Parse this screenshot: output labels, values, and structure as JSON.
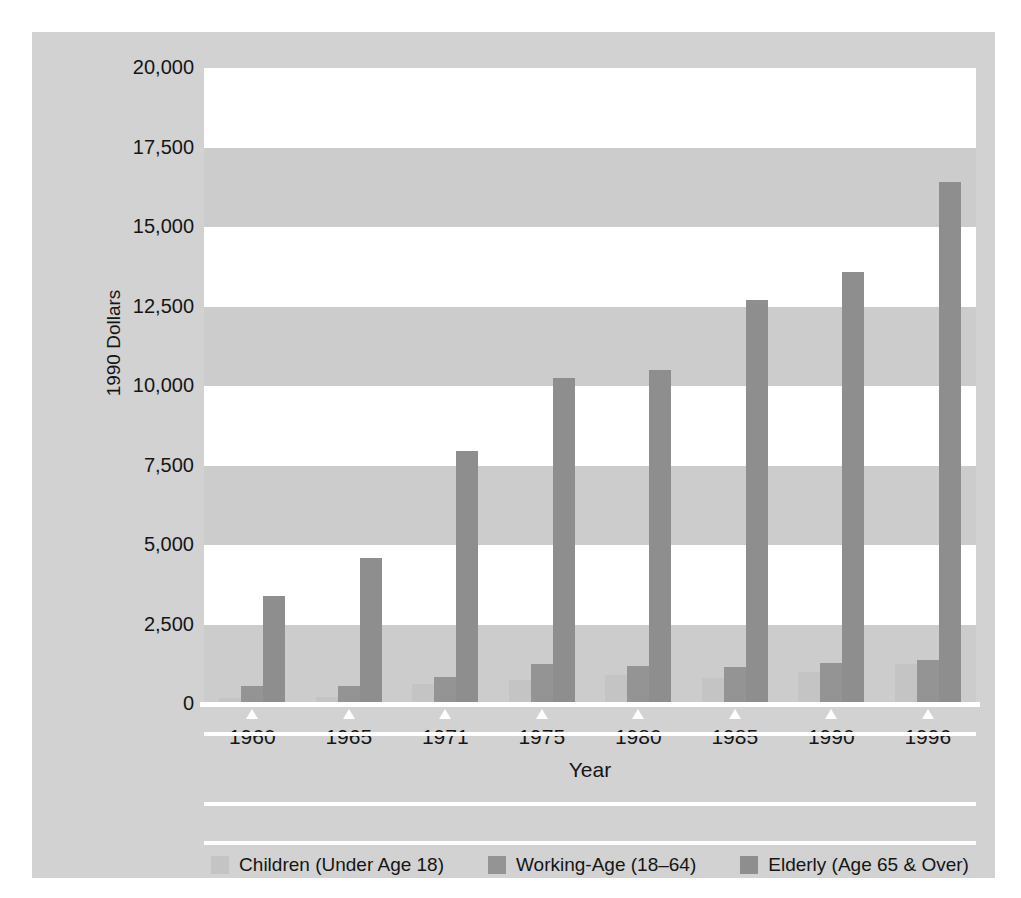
{
  "chart_data": {
    "type": "bar",
    "title": "",
    "xlabel": "Year",
    "ylabel": "1990 Dollars",
    "categories": [
      "1960",
      "1965",
      "1971",
      "1975",
      "1980",
      "1985",
      "1990",
      "1996"
    ],
    "ylim": [
      0,
      20000
    ],
    "yticks": [
      0,
      2500,
      5000,
      7500,
      10000,
      12500,
      15000,
      17500,
      20000
    ],
    "ytick_labels": [
      "0",
      "2,500",
      "5,000",
      "7,500",
      "10,000",
      "12,500",
      "15,000",
      "17,500",
      "20,000"
    ],
    "grid": "horizontal-bands",
    "legend_position": "bottom",
    "series": [
      {
        "name": "Children (Under Age 18)",
        "color": "#c4c4c4",
        "values": [
          180,
          220,
          620,
          740,
          900,
          830,
          1020,
          1270
        ]
      },
      {
        "name": "Working-Age (18–64)",
        "color": "#949494",
        "values": [
          570,
          560,
          840,
          1270,
          1200,
          1170,
          1280,
          1370
        ]
      },
      {
        "name": "Elderly (Age 65 & Over)",
        "color": "#8e8e8e",
        "values": [
          3400,
          4600,
          7950,
          10250,
          10500,
          12700,
          13600,
          16400
        ]
      }
    ]
  },
  "axes": {
    "y_title": "1990 Dollars",
    "x_title": "Year"
  },
  "legend": {
    "items": [
      {
        "label": "Children (Under Age 18)",
        "color": "#c4c4c4"
      },
      {
        "label": "Working-Age (18–64)",
        "color": "#949494"
      },
      {
        "label": "Elderly (Age 65 & Over)",
        "color": "#8e8e8e"
      }
    ]
  },
  "colors": {
    "figure_background": "#ffffff",
    "panel_background": "#d2d2d2",
    "band_light": "#ffffff",
    "band_dark": "#cccccc",
    "axis_line": "#ffffff",
    "text": "#151515"
  }
}
